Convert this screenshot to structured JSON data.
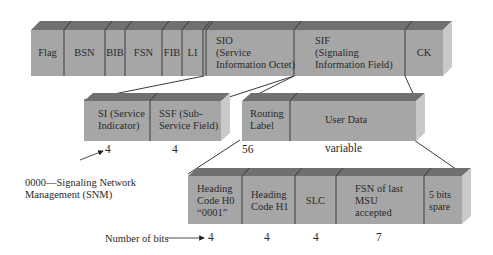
{
  "colors": {
    "front": "#a6a6a6",
    "top": "#707070",
    "side": "#c9c9c9",
    "divider": "#3a3a3a",
    "text": "#2a2a2a"
  },
  "top_bar": {
    "fields": [
      {
        "id": "flag",
        "label": "Flag"
      },
      {
        "id": "bsn",
        "label": "BSN"
      },
      {
        "id": "bib",
        "label": "BIB"
      },
      {
        "id": "fsn",
        "label": "FSN"
      },
      {
        "id": "fib",
        "label": "FIB"
      },
      {
        "id": "li",
        "label": "LI"
      },
      {
        "id": "sio",
        "label_lines": [
          "SIO",
          "(Service",
          "Information Octet)"
        ]
      },
      {
        "id": "sif",
        "label_lines": [
          "SIF",
          "(Signaling",
          "Information Field)"
        ]
      },
      {
        "id": "ck",
        "label": "CK"
      }
    ]
  },
  "sio_bar": {
    "fields": [
      {
        "id": "si",
        "label_lines": [
          "SI (Service",
          "Indicator)"
        ],
        "bits": "4"
      },
      {
        "id": "ssf",
        "label_lines": [
          "SSF (Sub-",
          "Service Field)"
        ],
        "bits": "4"
      }
    ]
  },
  "sif_bar": {
    "fields": [
      {
        "id": "routing",
        "label_lines": [
          "Routing",
          "Label"
        ],
        "bits": "56"
      },
      {
        "id": "user_data",
        "label": "User Data",
        "bits": "variable"
      }
    ]
  },
  "user_data_bar": {
    "fields": [
      {
        "id": "h0",
        "label_lines": [
          "Heading",
          "Code H0",
          "“0001”"
        ],
        "bits": "4"
      },
      {
        "id": "h1",
        "label_lines": [
          "Heading",
          "Code H1"
        ],
        "bits": "4"
      },
      {
        "id": "slc",
        "label": "SLC",
        "bits": "4"
      },
      {
        "id": "fsn_last",
        "label_lines": [
          "FSN of last",
          "MSU",
          "accepted"
        ],
        "bits": "7"
      },
      {
        "id": "spare",
        "label_lines": [
          "5 bits",
          "spare"
        ],
        "bits": ""
      }
    ]
  },
  "annotations": {
    "snm_lines": [
      "0000—Signaling Network",
      "Management (SNM)"
    ],
    "number_of_bits": "Number of bits"
  }
}
